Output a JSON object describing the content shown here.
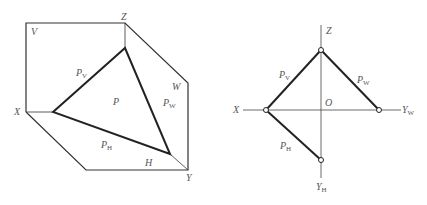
{
  "left_figure": {
    "labels": {
      "V": "V",
      "Z": "Z",
      "X": "X",
      "W": "W",
      "H": "H",
      "Y": "Y",
      "P": "P",
      "Pv_main": "P",
      "Pv_sub": "V",
      "Pw_main": "P",
      "Pw_sub": "W",
      "Ph_main": "P",
      "Ph_sub": "H"
    }
  },
  "right_figure": {
    "labels": {
      "Z": "Z",
      "X": "X",
      "O": "O",
      "Yw_main": "Y",
      "Yw_sub": "W",
      "Yh_main": "Y",
      "Yh_sub": "H",
      "Pv_main": "P",
      "Pv_sub": "V",
      "Pw_main": "P",
      "Pw_sub": "W",
      "Ph_main": "P",
      "Ph_sub": "H"
    }
  },
  "colors": {
    "thin_line": "#333333",
    "thick_line": "#222222",
    "label": "#555555"
  }
}
